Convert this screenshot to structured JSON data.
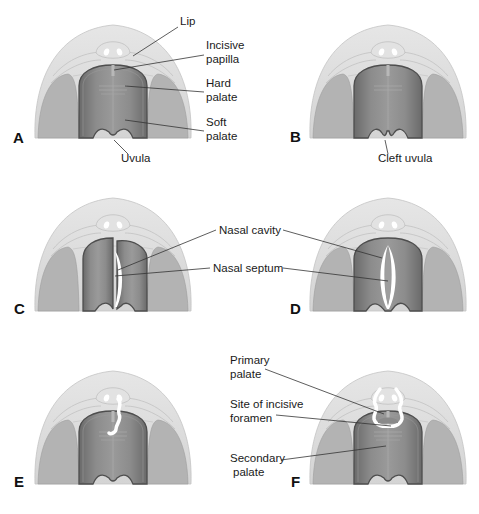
{
  "figure": {
    "panels": [
      {
        "id": "A",
        "letter": "A",
        "labels": [
          "Lip",
          "Incisive papilla",
          "Hard palate",
          "Soft palate",
          "Uvula"
        ]
      },
      {
        "id": "B",
        "letter": "B",
        "labels": [
          "Cleft uvula"
        ]
      },
      {
        "id": "C",
        "letter": "C",
        "labels": [
          "Nasal cavity",
          "Nasal septum"
        ]
      },
      {
        "id": "D",
        "letter": "D",
        "labels": [
          "Nasal cavity",
          "Nasal septum"
        ]
      },
      {
        "id": "E",
        "letter": "E",
        "labels": []
      },
      {
        "id": "F",
        "letter": "F",
        "labels": [
          "Primary palate",
          "Site of incisive foramen",
          "Secondary palate"
        ]
      }
    ],
    "labels": {
      "lip": "Lip",
      "incisive_papilla_1": "Incisive",
      "incisive_papilla_2": "papilla",
      "hard_palate_1": "Hard",
      "hard_palate_2": "palate",
      "soft_palate_1": "Soft",
      "soft_palate_2": "palate",
      "uvula": "Uvula",
      "cleft_uvula": "Cleft uvula",
      "nasal_cavity": "Nasal cavity",
      "nasal_septum": "Nasal septum",
      "primary_palate_1": "Primary",
      "primary_palate_2": "palate",
      "incisive_foramen_1": "Site of incisive",
      "incisive_foramen_2": "foramen",
      "secondary_palate_1": "Secondary",
      "secondary_palate_2": "palate"
    },
    "colors": {
      "outer_dome": "#dcdcdc",
      "side_lobe": "#b5b5b5",
      "palate_dark": "#7a7a7a",
      "palate_rim": "#5a5a5a",
      "cleft": "#ffffff",
      "leader_line": "#333333"
    }
  }
}
